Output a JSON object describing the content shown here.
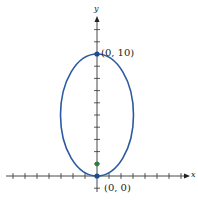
{
  "figure": {
    "type": "ellipse-graph",
    "axes": {
      "x_label": "x",
      "y_label": "y",
      "x_range": [
        -7,
        7
      ],
      "y_range": [
        -2,
        13
      ],
      "tick_spacing": 1
    },
    "ellipse": {
      "center": [
        0,
        5
      ],
      "semi_axis_x": 3,
      "semi_axis_y": 5,
      "color": "#2b5aa0"
    },
    "points": [
      {
        "label": "(0, 10)",
        "coords": [
          0,
          10
        ],
        "color": "#1d4b8f"
      },
      {
        "label": "(0, 0)",
        "coords": [
          0,
          0
        ],
        "color": "#1d4b8f"
      },
      {
        "label": "",
        "coords": [
          0,
          1
        ],
        "color": "#2e7d4f",
        "role": "focus"
      }
    ]
  }
}
